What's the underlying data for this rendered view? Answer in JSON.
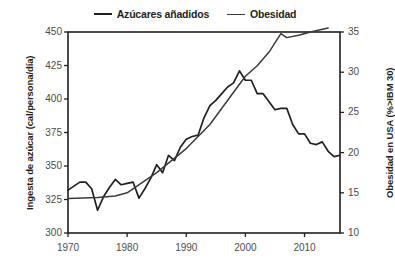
{
  "chart_data": {
    "type": "line",
    "title": "",
    "xlabel": "",
    "ylabel": "Ingesta de azúcar (cal/persona/día)",
    "ylabel_right": "Obesidad en USA (%>IBM 30)",
    "xlim": [
      1970,
      2016
    ],
    "ylim": [
      300,
      450
    ],
    "ylim_right": [
      10,
      35
    ],
    "xticks": [
      1970,
      1980,
      1990,
      2000,
      2010
    ],
    "xtick_labels": [
      "1970",
      "1980",
      "1990",
      "2000",
      "2010"
    ],
    "yticks": [
      300,
      325,
      350,
      375,
      400,
      425,
      450
    ],
    "ytick_labels": [
      "300",
      "325",
      "350",
      "375",
      "400",
      "425",
      "450"
    ],
    "yticks_right": [
      10,
      15,
      20,
      25,
      30,
      35
    ],
    "ytick_labels_right": [
      "10",
      "15",
      "20",
      "25",
      "30",
      "35"
    ],
    "grid": false,
    "legend_position": "top-center",
    "series": [
      {
        "name": "Azúcares añadidos",
        "axis": "left",
        "color": "#231f20",
        "x": [
          1970,
          1971,
          1972,
          1973,
          1974,
          1975,
          1976,
          1977,
          1978,
          1979,
          1980,
          1981,
          1982,
          1983,
          1984,
          1985,
          1986,
          1987,
          1988,
          1989,
          1990,
          1991,
          1992,
          1993,
          1994,
          1995,
          1996,
          1997,
          1998,
          1999,
          2000,
          2001,
          2002,
          2003,
          2004,
          2005,
          2006,
          2007,
          2008,
          2009,
          2010,
          2011,
          2012,
          2013,
          2014,
          2015,
          2016
        ],
        "values": [
          332,
          335,
          338,
          338,
          333,
          317,
          327,
          334,
          340,
          336,
          337,
          338,
          326,
          333,
          341,
          351,
          345,
          358,
          354,
          364,
          370,
          372,
          373,
          386,
          395,
          399,
          404,
          409,
          412,
          421,
          414,
          414,
          404,
          404,
          398,
          392,
          393,
          393,
          381,
          374,
          374,
          367,
          366,
          368,
          361,
          357,
          358
        ]
      },
      {
        "name": "Obesidad",
        "axis": "right",
        "color": "#3a3a3a",
        "x": [
          1970,
          1975,
          1978,
          1980,
          1985,
          1990,
          1994,
          1998,
          2000,
          2002,
          2004,
          2006,
          2007,
          2009,
          2011,
          2014
        ],
        "values": [
          14.3,
          14.4,
          14.6,
          15.0,
          17.5,
          20.5,
          23.5,
          27.5,
          29.5,
          30.8,
          32.5,
          34.8,
          34.3,
          34.6,
          35.0,
          35.5
        ]
      }
    ]
  },
  "legend": {
    "items": [
      {
        "label": "Azúcares añadidos"
      },
      {
        "label": "Obesidad"
      }
    ]
  },
  "axes": {
    "left_title": "Ingesta de azúcar (cal/persona/día)",
    "right_title": "Obesidad en USA (%>IBM 30)"
  },
  "colors": {
    "sugar_line": "#231f20",
    "obesity_line": "#3a3a3a",
    "frame": "#231f20",
    "tick_text": "#4c4c4c",
    "background": "#ffffff"
  }
}
